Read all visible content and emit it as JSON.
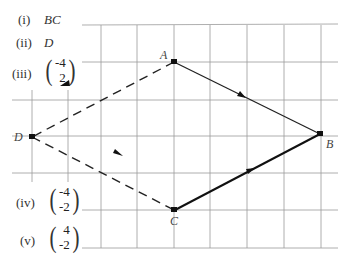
{
  "answers": [
    {
      "number": "(i)",
      "value": "BC"
    },
    {
      "number": "(ii)",
      "value": "D"
    },
    {
      "number": "(iii)",
      "vector": [
        "-4",
        "2"
      ]
    },
    {
      "number": "(iv)",
      "vector": [
        "-4",
        "-2"
      ]
    },
    {
      "number": "(v)",
      "vector": [
        "4",
        "-2"
      ]
    }
  ],
  "points": {
    "A": "A",
    "B": "B",
    "C": "C",
    "D": "D"
  },
  "grid": {
    "vertical_x": [
      32,
      68,
      101,
      137,
      174,
      210,
      247,
      284,
      321
    ],
    "horizontal_y": [
      25,
      62,
      100,
      136,
      173,
      210,
      248
    ],
    "color": "#9a9a9a"
  },
  "segments": [
    {
      "from": "A",
      "to": "B",
      "style": "solid"
    },
    {
      "from": "B",
      "to": "C",
      "style": "solid",
      "arrow": "toward C"
    },
    {
      "from": "A",
      "to": "D",
      "style": "dashed",
      "arrow": "toward D"
    },
    {
      "from": "D",
      "to": "C",
      "style": "dashed",
      "arrow": "toward C"
    }
  ]
}
